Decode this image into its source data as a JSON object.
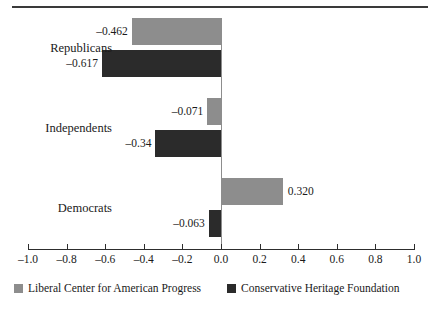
{
  "chart_data": {
    "type": "bar",
    "orientation": "horizontal",
    "title": "",
    "subtitle": "",
    "xlabel": "",
    "ylabel": "",
    "xlim": [
      -1.0,
      1.0
    ],
    "xticks": [
      "-1.0",
      "-0.8",
      "-0.6",
      "-0.4",
      "-0.2",
      "0.0",
      "0.2",
      "0.4",
      "0.6",
      "0.8",
      "1.0"
    ],
    "xtick_values": [
      -1.0,
      -0.8,
      -0.6,
      -0.4,
      -0.2,
      0.0,
      0.2,
      0.4,
      0.6,
      0.8,
      1.0
    ],
    "grid": false,
    "zero_line": true,
    "legend_position": "bottom",
    "categories": [
      "Republicans",
      "Independents",
      "Democrats"
    ],
    "series": [
      {
        "name": "Liberal Center for American Progress",
        "color": "#8d8d8d",
        "values": [
          -0.462,
          -0.071,
          0.32
        ],
        "labels": [
          "–0.462",
          "–0.071",
          "0.320"
        ]
      },
      {
        "name": "Conservative Heritage Foundation",
        "color": "#2b2b2b",
        "values": [
          -0.617,
          -0.34,
          -0.063
        ],
        "labels": [
          "–0.617",
          "–0.34",
          "–0.063"
        ]
      }
    ]
  },
  "legend": {
    "items": [
      {
        "label": "Liberal Center for American Progress",
        "swatch": "light-gray-swatch"
      },
      {
        "label": "Conservative Heritage Foundation",
        "swatch": "dark-swatch"
      }
    ]
  },
  "colors": {
    "liberal_bar": "#8d8d8d",
    "conservative_bar": "#2b2b2b",
    "axis": "#2d2d2d",
    "zero_line": "#8d8d8d",
    "rule": "#3a3a3a",
    "text": "#1a1a1a",
    "background": "#ffffff"
  }
}
